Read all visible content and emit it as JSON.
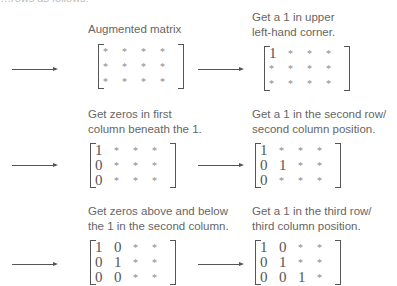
{
  "clipped_intro": "…rows as follows:",
  "steps": [
    {
      "caption_lines": [
        "Augmented matrix"
      ],
      "matrix": [
        [
          "*",
          "*",
          "*",
          "*"
        ],
        [
          "*",
          "*",
          "*",
          "*"
        ],
        [
          "*",
          "*",
          "*",
          "*"
        ]
      ]
    },
    {
      "caption_lines": [
        "Get a 1 in upper",
        "left-hand corner."
      ],
      "matrix": [
        [
          "1",
          "*",
          "*",
          "*"
        ],
        [
          "*",
          "*",
          "*",
          "*"
        ],
        [
          "*",
          "*",
          "*",
          "*"
        ]
      ]
    },
    {
      "caption_lines": [
        "Get zeros in first",
        "column beneath the 1."
      ],
      "matrix": [
        [
          "1",
          "*",
          "*",
          "*"
        ],
        [
          "0",
          "*",
          "*",
          "*"
        ],
        [
          "0",
          "*",
          "*",
          "*"
        ]
      ]
    },
    {
      "caption_lines": [
        "Get a 1 in the second row/",
        "second column position."
      ],
      "matrix": [
        [
          "1",
          "*",
          "*",
          "*"
        ],
        [
          "0",
          "1",
          "*",
          "*"
        ],
        [
          "0",
          "*",
          "*",
          "*"
        ]
      ]
    },
    {
      "caption_lines": [
        "Get zeros above and below",
        "the 1 in the second column."
      ],
      "matrix": [
        [
          "1",
          "0",
          "*",
          "*"
        ],
        [
          "0",
          "1",
          "*",
          "*"
        ],
        [
          "0",
          "0",
          "*",
          "*"
        ]
      ]
    },
    {
      "caption_lines": [
        "Get a 1 in the third row/",
        "third column position."
      ],
      "matrix": [
        [
          "1",
          "0",
          "*",
          "*"
        ],
        [
          "0",
          "1",
          "*",
          "*"
        ],
        [
          "0",
          "0",
          "1",
          "*"
        ]
      ]
    }
  ],
  "arrow_icon": "right-arrow-icon"
}
